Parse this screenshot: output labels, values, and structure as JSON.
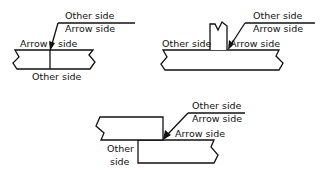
{
  "figure": {
    "colors": {
      "line": "#111111",
      "background": "#ffffff"
    }
  },
  "diagrams": [
    {
      "id": "butt-joint",
      "labels": {
        "ref_above": "Other side",
        "ref_below": "Arrow side",
        "arrow_left": "Arrow",
        "arrow_right": "side",
        "bottom": "Other side"
      }
    },
    {
      "id": "tee-joint",
      "labels": {
        "ref_above": "Other side",
        "ref_below": "Arrow side",
        "left": "Other side",
        "right": "Arrow side"
      }
    },
    {
      "id": "lap-joint",
      "labels": {
        "ref_above": "Other side",
        "ref_below": "Arrow side",
        "right": "Arrow side",
        "left_line1": "Other",
        "left_line2": "side"
      }
    }
  ]
}
